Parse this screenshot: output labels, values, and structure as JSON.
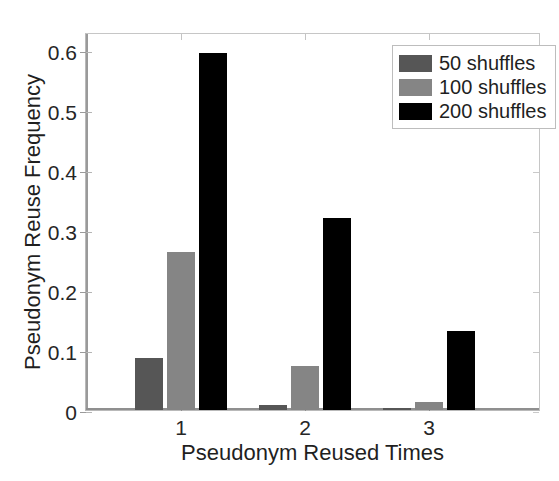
{
  "chart_data": {
    "type": "bar",
    "title": "",
    "xlabel": "Pseudonym Reused Times",
    "ylabel": "Pseudonym Reuse Frequency",
    "categories": [
      "1",
      "2",
      "3"
    ],
    "series": [
      {
        "name": "50 shuffles",
        "color": "#565656",
        "values": [
          0.086,
          0.008,
          0.003
        ]
      },
      {
        "name": "100 shuffles",
        "color": "#858585",
        "values": [
          0.263,
          0.073,
          0.013
        ]
      },
      {
        "name": "200 shuffles",
        "color": "#000000",
        "values": [
          0.595,
          0.32,
          0.132
        ]
      }
    ],
    "ylim": [
      0,
      0.63
    ],
    "yticks": [
      0,
      0.1,
      0.2,
      0.3,
      0.4,
      0.5,
      0.6
    ],
    "ytick_labels": [
      "0",
      "0.1",
      "0.2",
      "0.3",
      "0.4",
      "0.5",
      "0.6"
    ],
    "xtick_labels": [
      "1",
      "2",
      "3"
    ],
    "grid": false,
    "legend_position": "top-right",
    "legend_entries": [
      "50 shuffles",
      "100 shuffles",
      "200 shuffles"
    ],
    "axis_color": "#8f8f8f",
    "background": "#ffffff"
  }
}
